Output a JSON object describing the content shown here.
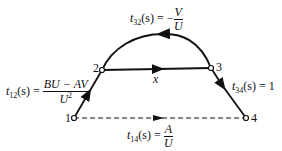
{
  "diagram": {
    "type": "signal-flow-graph",
    "nodes": [
      {
        "id": "1",
        "label": "1"
      },
      {
        "id": "2",
        "label": "2"
      },
      {
        "id": "3",
        "label": "3"
      },
      {
        "id": "4",
        "label": "4"
      }
    ],
    "edges": [
      {
        "from": "1",
        "to": "2",
        "style": "solid",
        "label": "t12(s) = (BU − AV)/U²"
      },
      {
        "from": "2",
        "to": "3",
        "style": "solid",
        "label": "x"
      },
      {
        "from": "3",
        "to": "2",
        "style": "solid-arc",
        "label": "t32(s) = −V/U"
      },
      {
        "from": "3",
        "to": "4",
        "style": "solid",
        "label": "t34(s) = 1"
      },
      {
        "from": "1",
        "to": "4",
        "style": "dashed",
        "label": "t14(s) = A/U"
      }
    ]
  },
  "labels": {
    "t32": {
      "t": "t",
      "sub": "32",
      "arg": "(s) = −",
      "num": "V",
      "den": "U"
    },
    "t12": {
      "t": "t",
      "sub": "12",
      "arg": "(s) = ",
      "num": "BU − AV",
      "den": "U",
      "den_sup": "2"
    },
    "t34": {
      "t": "t",
      "sub": "34",
      "arg": "(s) = 1"
    },
    "t14": {
      "t": "t",
      "sub": "14",
      "arg": "(s) = ",
      "num": "A",
      "den": "U"
    },
    "x": "x"
  },
  "node_labels": {
    "n1": "1",
    "n2": "2",
    "n3": "3",
    "n4": "4"
  }
}
